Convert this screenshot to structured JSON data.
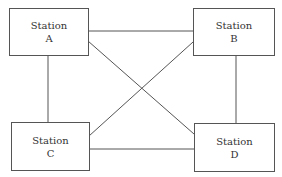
{
  "diagram": {
    "type": "fully-connected network topology",
    "stations": [
      {
        "id": "A",
        "line1": "Station",
        "line2": "A"
      },
      {
        "id": "B",
        "line1": "Station",
        "line2": "B"
      },
      {
        "id": "C",
        "line1": "Station",
        "line2": "C"
      },
      {
        "id": "D",
        "line1": "Station",
        "line2": "D"
      }
    ],
    "links": [
      [
        "A",
        "B"
      ],
      [
        "A",
        "C"
      ],
      [
        "A",
        "D"
      ],
      [
        "B",
        "C"
      ],
      [
        "B",
        "D"
      ],
      [
        "C",
        "D"
      ]
    ]
  }
}
